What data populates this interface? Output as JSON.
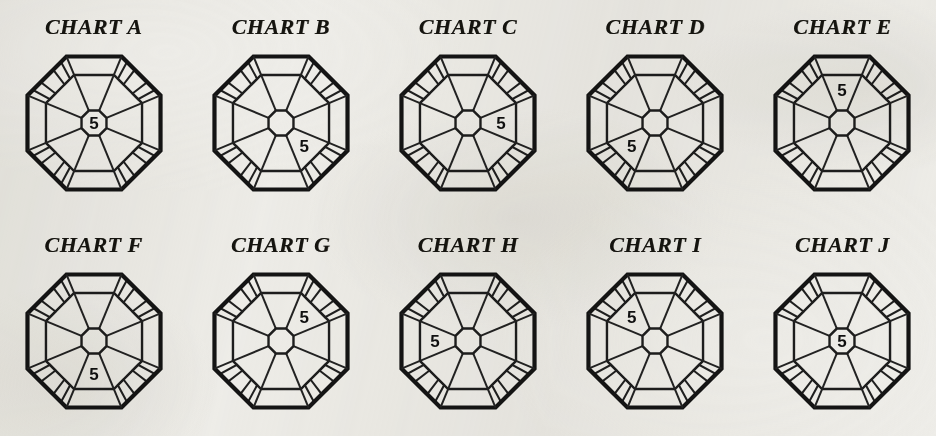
{
  "page": {
    "background_color": "#efeeea",
    "ink_color": "#141414",
    "rows": 2,
    "columns": 5
  },
  "charts": [
    {
      "id": "a",
      "label": "CHART A",
      "marker_value": "5",
      "marker_position": "center"
    },
    {
      "id": "b",
      "label": "CHART B",
      "marker_value": "5",
      "marker_position": "lower-right"
    },
    {
      "id": "c",
      "label": "CHART C",
      "marker_value": "5",
      "marker_position": "right"
    },
    {
      "id": "d",
      "label": "CHART D",
      "marker_value": "5",
      "marker_position": "lower-left"
    },
    {
      "id": "e",
      "label": "CHART E",
      "marker_value": "5",
      "marker_position": "top"
    },
    {
      "id": "f",
      "label": "CHART F",
      "marker_value": "5",
      "marker_position": "bottom"
    },
    {
      "id": "g",
      "label": "CHART G",
      "marker_value": "5",
      "marker_position": "upper-right"
    },
    {
      "id": "h",
      "label": "CHART H",
      "marker_value": "5",
      "marker_position": "left"
    },
    {
      "id": "i",
      "label": "CHART I",
      "marker_value": "5",
      "marker_position": "upper-left"
    },
    {
      "id": "j",
      "label": "CHART J",
      "marker_value": "5",
      "marker_position": "center"
    }
  ],
  "chart_data": {
    "type": "diagram",
    "title": "",
    "diagram_shape": "octagon",
    "sector_count": 8,
    "sector_positions": [
      "top",
      "upper-right",
      "right",
      "lower-right",
      "bottom",
      "lower-left",
      "left",
      "upper-left"
    ],
    "center_label_shape": "octagon",
    "marker_label": "5",
    "categories": [
      "CHART A",
      "CHART B",
      "CHART C",
      "CHART D",
      "CHART E",
      "CHART F",
      "CHART G",
      "CHART H",
      "CHART I",
      "CHART J"
    ],
    "values": [
      {
        "chart": "CHART A",
        "marker": "5",
        "sector": "center"
      },
      {
        "chart": "CHART B",
        "marker": "5",
        "sector": "lower-right"
      },
      {
        "chart": "CHART C",
        "marker": "5",
        "sector": "right"
      },
      {
        "chart": "CHART D",
        "marker": "5",
        "sector": "lower-left"
      },
      {
        "chart": "CHART E",
        "marker": "5",
        "sector": "top"
      },
      {
        "chart": "CHART F",
        "marker": "5",
        "sector": "bottom"
      },
      {
        "chart": "CHART G",
        "marker": "5",
        "sector": "upper-right"
      },
      {
        "chart": "CHART H",
        "marker": "5",
        "sector": "left"
      },
      {
        "chart": "CHART I",
        "marker": "5",
        "sector": "upper-left"
      },
      {
        "chart": "CHART J",
        "marker": "5",
        "sector": "center"
      }
    ],
    "xlabel": "",
    "ylabel": "",
    "legend": [],
    "grid": false
  }
}
